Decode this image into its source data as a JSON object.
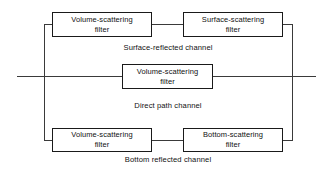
{
  "diagram": {
    "line_color": "#3a3a3a",
    "box_border_color": "#1a1a1a",
    "text_color": "#111111",
    "background": "#ffffff",
    "channels": [
      {
        "id": "surface-reflected",
        "label": "Surface-reflected channel",
        "blocks": [
          {
            "line1": "Volume-scattering",
            "line2": "filter"
          },
          {
            "line1": "Surface-scattering",
            "line2": "filter"
          }
        ]
      },
      {
        "id": "direct-path",
        "label": "Direct path channel",
        "blocks": [
          {
            "line1": "Volume-scattering",
            "line2": "filter"
          }
        ]
      },
      {
        "id": "bottom-reflected",
        "label": "Bottom reflected channel",
        "blocks": [
          {
            "line1": "Volume-scattering",
            "line2": "filter"
          },
          {
            "line1": "Bottom-scattering",
            "line2": "filter"
          }
        ]
      }
    ]
  }
}
